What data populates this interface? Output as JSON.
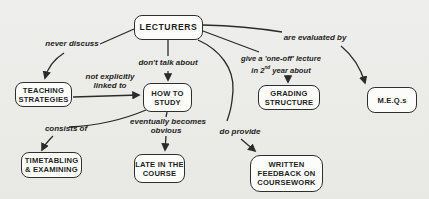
{
  "map": {
    "title_hint": "concept map about lecturers",
    "colors": {
      "background": "#ebebe8",
      "ink": "#2b2b2b",
      "box_fill": "#fcfcfb"
    },
    "nodes": [
      {
        "id": "lecturers",
        "lines": [
          "LECTURERS"
        ]
      },
      {
        "id": "teaching-strategies",
        "lines": [
          "TEACHING",
          "STRATEGIES"
        ]
      },
      {
        "id": "how-to-study",
        "lines": [
          "HOW TO",
          "STUDY"
        ]
      },
      {
        "id": "grading-structure",
        "lines": [
          "GRADING",
          "STRUCTURE"
        ]
      },
      {
        "id": "meqs",
        "lines": [
          "M.E.Q.s"
        ]
      },
      {
        "id": "timetabling-examining",
        "lines": [
          "TIMETABLING",
          "& EXAMINING"
        ]
      },
      {
        "id": "late-in-the-course",
        "lines": [
          "LATE IN THE",
          "COURSE"
        ]
      },
      {
        "id": "written-feedback",
        "lines": [
          "WRITTEN",
          "FEEDBACK ON",
          "COURSEWORK"
        ]
      }
    ],
    "edges": [
      {
        "id": "never-discuss",
        "label": "never discuss"
      },
      {
        "id": "dont-talk-about",
        "label": "don't talk about"
      },
      {
        "id": "not-explicitly-linked",
        "line1": "not explicitly",
        "line2": "linked to"
      },
      {
        "id": "one-off-lecture",
        "line1": "give a 'one-off' lecture",
        "line2_pre": "in 2",
        "line2_sup": "nd",
        "line2_post": " year about"
      },
      {
        "id": "are-evaluated-by",
        "label": "are evaluated by"
      },
      {
        "id": "consists-of",
        "label": "consists of"
      },
      {
        "id": "eventually-obvious",
        "line1": "eventually becomes",
        "line2": "obvious"
      },
      {
        "id": "do-provide",
        "label": "do provide"
      }
    ]
  }
}
